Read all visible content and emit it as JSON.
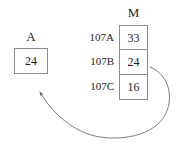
{
  "diagram": {
    "type": "register-memory-transfer",
    "register": {
      "label": "A",
      "value": "24"
    },
    "memory": {
      "label": "M",
      "rows": [
        {
          "address": "107A",
          "value": "33"
        },
        {
          "address": "107B",
          "value": "24"
        },
        {
          "address": "107C",
          "value": "16"
        }
      ]
    },
    "arrow": {
      "name": "memory-to-register-arrow",
      "from": "107B",
      "to": "A",
      "style": "curved"
    },
    "colors": {
      "text": "#1c1c1c",
      "border": "#8a8a8a",
      "arrow": "#6e6e6e",
      "background": "#ffffff"
    }
  }
}
